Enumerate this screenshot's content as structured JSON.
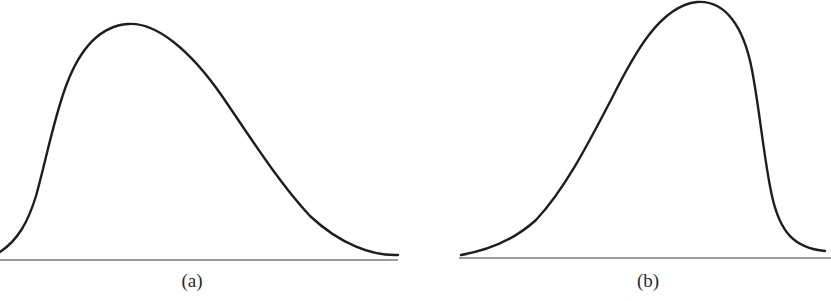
{
  "colors": {
    "background": "#ffffff",
    "curve": "#1e1e1e",
    "axis": "#7a7a7a"
  },
  "panels": [
    {
      "label": "(a)",
      "description": "Right-skewed (positively skewed) unimodal curve",
      "label_pos": [
        192,
        270
      ],
      "baseline": {
        "x1": 0,
        "x2": 398,
        "y": 260
      },
      "curve_path": "M 0 252 C 18 240, 28 222, 36 196 C 46 160, 54 118, 66 86 C 80 48, 100 26, 128 24 C 156 22, 190 50, 222 96 C 252 140, 280 184, 310 216 C 340 244, 372 256, 398 255"
    },
    {
      "label": "(b)",
      "description": "Left-skewed (negatively skewed) unimodal curve",
      "label_pos": [
        648,
        270
      ],
      "baseline": {
        "x1": 459,
        "x2": 831,
        "y": 258
      },
      "curve_path": "M 461 255 C 490 250, 514 240, 536 220 C 566 188, 590 140, 612 98 C 634 54, 660 6, 697 2 C 726 0, 744 28, 752 70 C 760 112, 764 160, 772 196 C 780 232, 794 248, 825 251"
    }
  ],
  "chart_data": [
    {
      "type": "line",
      "title": "(a)",
      "xlabel": "",
      "ylabel": "",
      "grid": false,
      "shape": "right-skewed distribution",
      "x": [
        0,
        0.08,
        0.16,
        0.24,
        0.32,
        0.4,
        0.48,
        0.56,
        0.64,
        0.72,
        0.8,
        0.88,
        0.96,
        1.0
      ],
      "values": [
        0.03,
        0.22,
        0.62,
        0.92,
        1.0,
        0.94,
        0.8,
        0.62,
        0.44,
        0.28,
        0.15,
        0.07,
        0.02,
        0.02
      ],
      "ylim": [
        0,
        1
      ]
    },
    {
      "type": "line",
      "title": "(b)",
      "xlabel": "",
      "ylabel": "",
      "grid": false,
      "shape": "left-skewed distribution",
      "x": [
        0,
        0.08,
        0.16,
        0.24,
        0.32,
        0.4,
        0.48,
        0.56,
        0.64,
        0.72,
        0.8,
        0.88,
        0.96,
        1.0
      ],
      "values": [
        0.01,
        0.05,
        0.13,
        0.26,
        0.44,
        0.63,
        0.82,
        0.96,
        1.0,
        0.93,
        0.62,
        0.24,
        0.05,
        0.02
      ],
      "ylim": [
        0,
        1
      ]
    }
  ]
}
